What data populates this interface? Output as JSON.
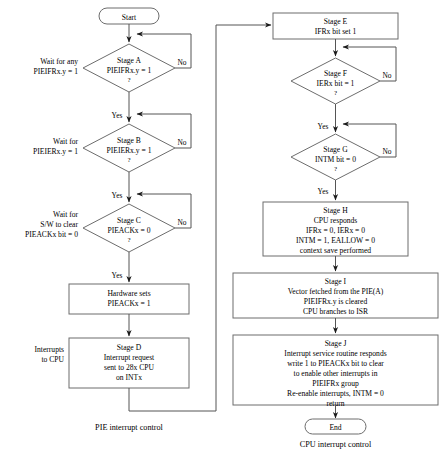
{
  "diagram": {
    "title_visible": false,
    "captions": {
      "left": "PIE interrupt control",
      "right": "CPU interrupt control"
    },
    "colors": {
      "shape_stroke": "#6d6d6d",
      "connector": "#555555",
      "text": "#000000",
      "background": "#ffffff"
    },
    "terminators": {
      "start": "Start",
      "end": "End"
    },
    "left_column": {
      "side_labels": [
        {
          "id": "wait-any",
          "lines": [
            "Wait for any",
            "PIEIFRx.y = 1"
          ]
        },
        {
          "id": "wait-ier",
          "lines": [
            "Wait for",
            "PIEIERx.y = 1"
          ]
        },
        {
          "id": "wait-sw-clear",
          "lines": [
            "Wait for",
            "S/W to clear",
            "PIEACKx bit = 0"
          ]
        },
        {
          "id": "interrupts-to-cpu",
          "lines": [
            "Interrupts",
            "to CPU"
          ]
        }
      ],
      "nodes": [
        {
          "id": "stage-a",
          "shape": "diamond",
          "lines": [
            "Stage A",
            "PIEIFRx.y = 1"
          ],
          "question": "?",
          "yes_label": "Yes",
          "no_label": "No"
        },
        {
          "id": "stage-b",
          "shape": "diamond",
          "lines": [
            "Stage B",
            "PIEIERx.y = 1"
          ],
          "question": "?",
          "yes_label": "Yes",
          "no_label": "No"
        },
        {
          "id": "stage-c",
          "shape": "diamond",
          "lines": [
            "Stage C",
            "PIEACKx = 0"
          ],
          "question": "?",
          "yes_label": "Yes",
          "no_label": "No"
        },
        {
          "id": "hardware-sets",
          "shape": "process",
          "lines": [
            "Hardware sets",
            "PIEACKx = 1"
          ]
        },
        {
          "id": "stage-d",
          "shape": "process",
          "lines": [
            "Stage D",
            "Interrupt request",
            "sent to 28x CPU",
            "on INTx"
          ]
        }
      ]
    },
    "right_column": {
      "nodes": [
        {
          "id": "stage-e",
          "shape": "process",
          "lines": [
            "Stage E",
            "IFRx bit set 1"
          ]
        },
        {
          "id": "stage-f",
          "shape": "diamond",
          "lines": [
            "Stage F",
            "IERx bit = 1"
          ],
          "question": "?",
          "yes_label": "Yes",
          "no_label": "No"
        },
        {
          "id": "stage-g",
          "shape": "diamond",
          "lines": [
            "Stage G",
            "INTM bit = 0"
          ],
          "question": "?",
          "yes_label": "Yes",
          "no_label": "No"
        },
        {
          "id": "stage-h",
          "shape": "process",
          "lines": [
            "Stage H",
            "CPU responds",
            "IFRx = 0, IERx = 0",
            "INTM = 1, EALLOW = 0",
            "context save performed"
          ]
        },
        {
          "id": "stage-i",
          "shape": "process",
          "lines": [
            "Stage I",
            "Vector fetched from the PIE(A)",
            "PIEIFRx.y is cleared",
            "CPU branches to ISR"
          ]
        },
        {
          "id": "stage-j",
          "shape": "process",
          "lines": [
            "Stage J",
            "Interrupt service routine responds",
            "write 1 to PIEACKx bit to clear",
            "to enable other interrupts in",
            "PIEIFRx group",
            "Re-enable interrupts, INTM = 0",
            "return"
          ]
        }
      ]
    }
  }
}
